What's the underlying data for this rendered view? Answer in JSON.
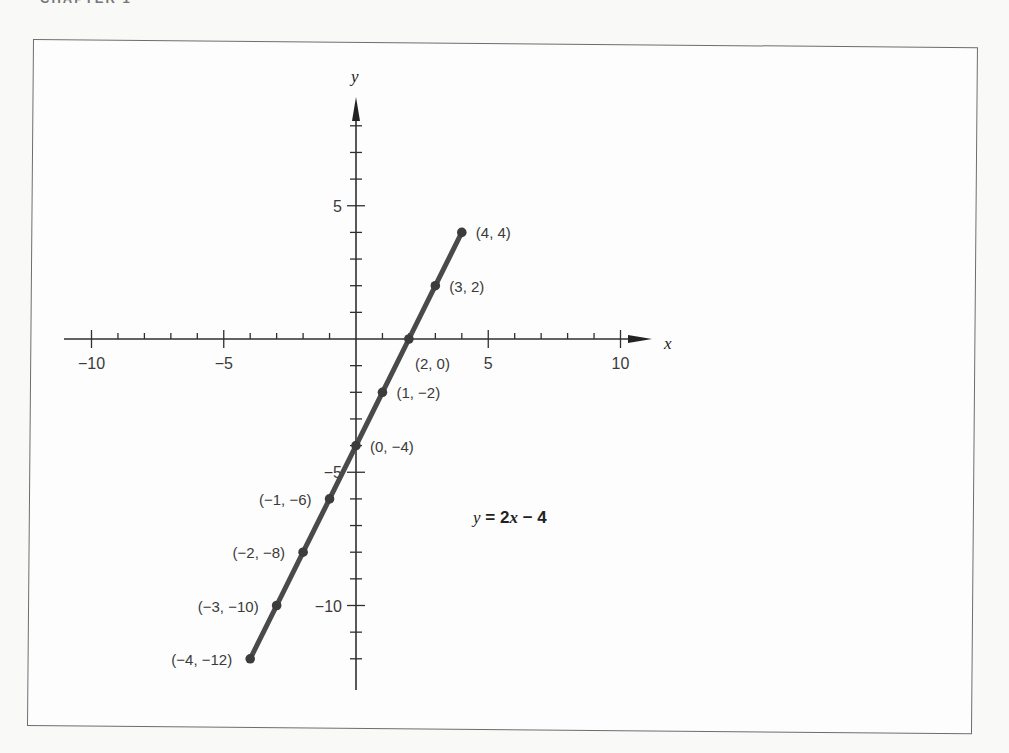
{
  "page": {
    "header": "CHAPTER 1",
    "background": "#f9f9f8",
    "frame_color": "#6d6d6d"
  },
  "chart_data": {
    "type": "line",
    "title": "",
    "equation": {
      "lhs": "y",
      "equals": "=",
      "coef": "2",
      "var": "x",
      "op": "−",
      "const": "4",
      "full": "y = 2x − 4"
    },
    "xlabel": "x",
    "ylabel": "y",
    "xlim": [
      -11,
      11.2
    ],
    "ylim": [
      -13,
      9
    ],
    "x_ticks": [
      -10,
      -9,
      -8,
      -7,
      -6,
      -5,
      -4,
      -3,
      -2,
      -1,
      1,
      2,
      3,
      4,
      5,
      6,
      7,
      8,
      9,
      10
    ],
    "y_ticks": [
      -12,
      -11,
      -10,
      -9,
      -8,
      -7,
      -6,
      -5,
      -4,
      -3,
      -2,
      -1,
      1,
      2,
      3,
      4,
      5,
      6,
      7,
      8
    ],
    "x_tick_labels": [
      {
        "value": -10,
        "text": "−10"
      },
      {
        "value": -5,
        "text": "−5"
      },
      {
        "value": 5,
        "text": "5"
      },
      {
        "value": 10,
        "text": "10"
      }
    ],
    "y_tick_labels": [
      {
        "value": 5,
        "text": "5"
      },
      {
        "value": -5,
        "text": "−5"
      },
      {
        "value": -10,
        "text": "−10"
      }
    ],
    "grid": false,
    "legend": null,
    "series": [
      {
        "name": "y = 2x − 4",
        "color": "#4a4a4a",
        "x": [
          -4,
          -3,
          -2,
          -1,
          0,
          1,
          2,
          3,
          4
        ],
        "y": [
          -12,
          -10,
          -8,
          -6,
          -4,
          -2,
          0,
          2,
          4
        ]
      }
    ],
    "point_labels": [
      {
        "x": 4,
        "y": 4,
        "text": "(4, 4)",
        "side": "right"
      },
      {
        "x": 3,
        "y": 2,
        "text": "(3, 2)",
        "side": "right"
      },
      {
        "x": 2,
        "y": 0,
        "text": "(2, 0)",
        "side": "below-right"
      },
      {
        "x": 1,
        "y": -2,
        "text": "(1, −2)",
        "side": "right"
      },
      {
        "x": 0,
        "y": -4,
        "text": "(0, −4)",
        "side": "right"
      },
      {
        "x": -1,
        "y": -6,
        "text": "(−1, −6)",
        "side": "left"
      },
      {
        "x": -2,
        "y": -8,
        "text": "(−2, −8)",
        "side": "left"
      },
      {
        "x": -3,
        "y": -10,
        "text": "(−3, −10)",
        "side": "left"
      },
      {
        "x": -4,
        "y": -12,
        "text": "(−4, −12)",
        "side": "left"
      }
    ]
  }
}
